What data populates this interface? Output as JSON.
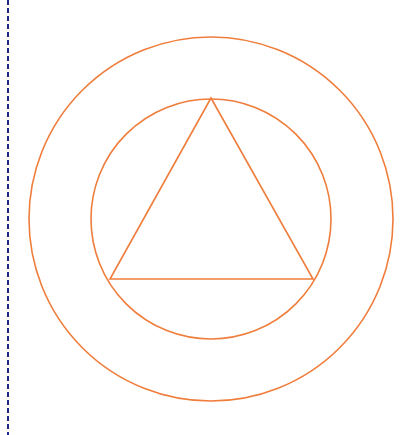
{
  "diagram": {
    "stroke_color": "#ef7d3c",
    "stroke_width": 1.6,
    "margin_line": {
      "color": "#1f2a8a",
      "x": 8,
      "dash": "5,3",
      "width": 2
    },
    "outer_circle": {
      "cx": 211,
      "cy": 219,
      "r": 182
    },
    "inner_circle": {
      "cx": 211,
      "cy": 219,
      "r": 120
    },
    "triangle": {
      "points": [
        [
          211,
          98
        ],
        [
          110,
          279
        ],
        [
          313,
          279
        ]
      ]
    }
  }
}
